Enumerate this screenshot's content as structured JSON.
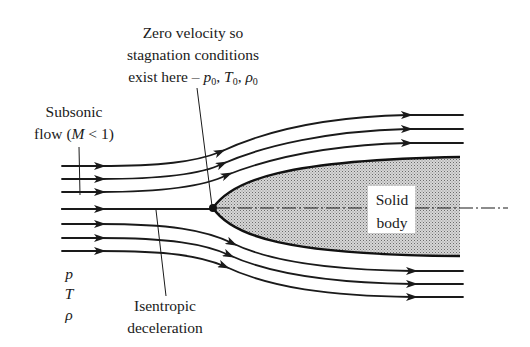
{
  "diagram": {
    "annotations": {
      "stagnation": {
        "lines": [
          "Zero velocity so",
          "stagnation conditions",
          "exist here – "
        ],
        "vars": [
          {
            "sym": "p",
            "sub": "0"
          },
          {
            "sym": "T",
            "sub": "0"
          },
          {
            "sym": "ρ",
            "sub": "0"
          }
        ]
      },
      "subsonic": {
        "line1": "Subsonic",
        "line2_prefix": "flow (",
        "line2_var": "M",
        "line2_suffix": " < 1)"
      },
      "isentropic": {
        "line1": "Isentropic",
        "line2": "deceleration"
      },
      "freestream_vars": [
        "p",
        "T",
        "ρ"
      ],
      "body_label": {
        "line1": "Solid",
        "line2": "body"
      }
    },
    "colors": {
      "ink": "#1a1a1a",
      "body_fill": "#bdbdbd",
      "background": "#ffffff"
    }
  }
}
